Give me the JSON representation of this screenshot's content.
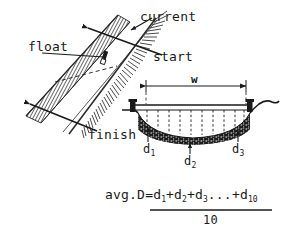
{
  "diagram": {
    "ink_color": "#1a1a1a",
    "background_color": "#ffffff"
  },
  "plan_view": {
    "labels": {
      "float": "float",
      "current": "current",
      "start": "start",
      "finish": "finish"
    },
    "icons": {
      "current_arrow": "arrow-down-left-icon",
      "float_object": "float-marker-icon",
      "bank_hatching": "bank-hatch-icon",
      "float_path": "dashed-path-icon"
    }
  },
  "cross_section": {
    "width_label": "w",
    "depth_labels": {
      "d1_base": "d",
      "d1_sub": "1",
      "d2_base": "d",
      "d2_sub": "2",
      "d3_base": "d",
      "d3_sub": "3"
    },
    "dashed_depth_line_count": 10,
    "icons": {
      "left_stake": "stake-icon",
      "right_stake": "stake-icon",
      "tape_line": "measuring-tape-icon",
      "streambed_fill": "streambed-sediment-icon",
      "width_dimension": "dimension-arrow-icon"
    }
  },
  "formula": {
    "numerator_prefix": "avg.D=d",
    "n1": "1",
    "plus1": "+d",
    "n2": "2",
    "plus2": "+d",
    "n3": "3",
    "ellipsis": "...+d",
    "n10": "10",
    "denominator": "10"
  }
}
